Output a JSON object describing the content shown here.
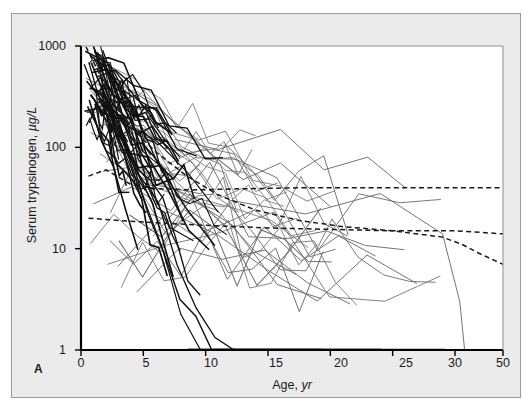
{
  "panel": {
    "label": "A"
  },
  "chart_data": {
    "type": "line",
    "title": "",
    "subtitle": "",
    "xlabel": "Age",
    "xlabel_unit": "yr",
    "ylabel": "Serum trypsinogen",
    "ylabel_unit": "µg/L",
    "yscale": "log",
    "ylim": [
      1,
      1000
    ],
    "ytick_labels": [
      "1000",
      "100",
      "10",
      "1"
    ],
    "ytick_values": [
      1000,
      100,
      10,
      1
    ],
    "xlim": [
      0,
      50
    ],
    "xtick_labels": [
      "0",
      "5",
      "10",
      "15",
      "20",
      "25",
      "30",
      "50"
    ],
    "xtick_values": [
      0,
      5,
      10,
      15,
      20,
      25,
      30,
      50
    ],
    "grid": false,
    "legend": "none",
    "axis_note": "x-axis is compressed between 30 and 50 yr",
    "colors": {
      "trajectory_dark": "#111111",
      "trajectory_light": "#6e6e6e",
      "reference_dashed": "#1a1a1a",
      "axis": "#000000",
      "panel_background": "#ebebeb",
      "plot_background": "#ffffff",
      "panel_border": "#9a9a9a"
    },
    "reference_curves": [
      {
        "name": "upper-plateau",
        "style": "dashed",
        "points": [
          [
            0.6,
            52
          ],
          [
            2,
            60
          ],
          [
            4,
            43
          ],
          [
            6,
            39
          ],
          [
            9,
            38
          ],
          [
            13,
            39
          ],
          [
            18,
            40
          ],
          [
            24,
            40
          ],
          [
            30,
            40
          ],
          [
            50,
            40
          ]
        ]
      },
      {
        "name": "middle-plateau",
        "style": "dashed",
        "points": [
          [
            0.6,
            20
          ],
          [
            3,
            19
          ],
          [
            6,
            18
          ],
          [
            10,
            17
          ],
          [
            15,
            16
          ],
          [
            20,
            15.5
          ],
          [
            25,
            15
          ],
          [
            30,
            15
          ],
          [
            50,
            14
          ]
        ]
      },
      {
        "name": "steep-decline",
        "style": "dashed",
        "points": [
          [
            0.4,
            980
          ],
          [
            1.2,
            620
          ],
          [
            2.5,
            300
          ],
          [
            4,
            160
          ],
          [
            6,
            90
          ],
          [
            8.5,
            52
          ],
          [
            11,
            34
          ],
          [
            14,
            24
          ],
          [
            17.5,
            19
          ],
          [
            21,
            16.5
          ],
          [
            25,
            15
          ],
          [
            29,
            13
          ],
          [
            33,
            11
          ],
          [
            40,
            9
          ],
          [
            50,
            7
          ]
        ]
      }
    ],
    "trajectory_count": 78,
    "trajectory_summary": {
      "peak_range": [
        200,
        1000
      ],
      "peak_age_range": [
        0.2,
        2
      ],
      "floor_value": 1,
      "note": "most trajectories decline steeply from infancy and flatten at the lower detection limit of 1 µg/L; a minority remain elevated between 10 and 200 µg/L into adolescence and adulthood"
    }
  }
}
